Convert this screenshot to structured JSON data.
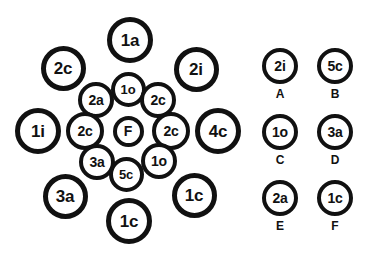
{
  "diagram": {
    "stroke_color": "#111111",
    "fill_color": "#ffffff",
    "background": "#ffffff",
    "cluster": {
      "name": "circle-cluster",
      "nodes": [
        {
          "id": "n-top",
          "label": "1a",
          "x": 130,
          "y": 40,
          "d": 46,
          "stroke": 5,
          "font": 17
        },
        {
          "id": "n-top-left",
          "label": "2c",
          "x": 63,
          "y": 68,
          "d": 45,
          "stroke": 5,
          "font": 17
        },
        {
          "id": "n-top-right",
          "label": "2i",
          "x": 196,
          "y": 69,
          "d": 45,
          "stroke": 5,
          "font": 17
        },
        {
          "id": "n-inner-top",
          "label": "1o",
          "x": 128,
          "y": 89,
          "d": 35,
          "stroke": 4,
          "font": 13
        },
        {
          "id": "n-inner-ul",
          "label": "2a",
          "x": 96,
          "y": 100,
          "d": 36,
          "stroke": 4,
          "font": 14
        },
        {
          "id": "n-inner-ur",
          "label": "2c",
          "x": 158,
          "y": 100,
          "d": 36,
          "stroke": 4,
          "font": 14
        },
        {
          "id": "n-left",
          "label": "1i",
          "x": 38,
          "y": 131,
          "d": 46,
          "stroke": 5,
          "font": 17
        },
        {
          "id": "n-inner-left",
          "label": "2c",
          "x": 85,
          "y": 131,
          "d": 38,
          "stroke": 4,
          "font": 14
        },
        {
          "id": "n-center",
          "label": "F",
          "x": 128,
          "y": 131,
          "d": 31,
          "stroke": 4,
          "font": 14
        },
        {
          "id": "n-inner-right",
          "label": "2c",
          "x": 171,
          "y": 131,
          "d": 38,
          "stroke": 4,
          "font": 14
        },
        {
          "id": "n-right",
          "label": "4c",
          "x": 218,
          "y": 131,
          "d": 46,
          "stroke": 5,
          "font": 17
        },
        {
          "id": "n-inner-ll",
          "label": "3a",
          "x": 97,
          "y": 162,
          "d": 36,
          "stroke": 4,
          "font": 14
        },
        {
          "id": "n-inner-lr",
          "label": "1o",
          "x": 159,
          "y": 161,
          "d": 36,
          "stroke": 4,
          "font": 14
        },
        {
          "id": "n-inner-bottom",
          "label": "5c",
          "x": 126,
          "y": 174,
          "d": 35,
          "stroke": 4,
          "font": 13
        },
        {
          "id": "n-bottom-left",
          "label": "3a",
          "x": 65,
          "y": 196,
          "d": 45,
          "stroke": 5,
          "font": 17
        },
        {
          "id": "n-bottom-right",
          "label": "1c",
          "x": 194,
          "y": 195,
          "d": 45,
          "stroke": 5,
          "font": 17
        },
        {
          "id": "n-bottom",
          "label": "1c",
          "x": 129,
          "y": 221,
          "d": 46,
          "stroke": 5,
          "font": 17
        }
      ]
    },
    "legend": {
      "name": "legend-panel",
      "items": [
        {
          "id": "legend-a",
          "value": "2i",
          "key": "A",
          "x": 280,
          "y": 66
        },
        {
          "id": "legend-b",
          "value": "5c",
          "key": "B",
          "x": 335,
          "y": 66
        },
        {
          "id": "legend-c",
          "value": "1o",
          "key": "C",
          "x": 280,
          "y": 132
        },
        {
          "id": "legend-d",
          "value": "3a",
          "key": "D",
          "x": 335,
          "y": 132
        },
        {
          "id": "legend-e",
          "value": "2a",
          "key": "E",
          "x": 280,
          "y": 198
        },
        {
          "id": "legend-f",
          "value": "1c",
          "key": "F",
          "x": 335,
          "y": 198
        }
      ]
    }
  }
}
